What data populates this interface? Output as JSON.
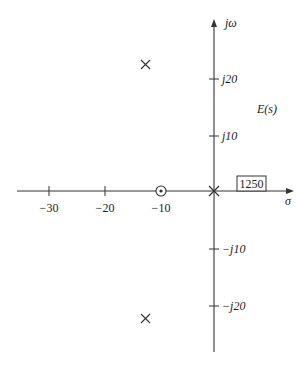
{
  "title": "E(s)",
  "axes": {
    "real_label": "σ",
    "imag_label": "jω",
    "real_ticks": [
      {
        "value": -30,
        "label": "−30"
      },
      {
        "value": -20,
        "label": "−20"
      },
      {
        "value": -10,
        "label": "−10"
      }
    ],
    "imag_ticks": [
      {
        "value": 20,
        "label": "j20"
      },
      {
        "value": 10,
        "label": "j10"
      },
      {
        "value": -10,
        "label": "−j10"
      },
      {
        "value": -20,
        "label": "−j20"
      }
    ]
  },
  "gain_box": "1250",
  "poles": [
    {
      "re": 0,
      "im": 0
    },
    {
      "re": -12.3,
      "im": 22.7
    },
    {
      "re": -12.3,
      "im": -22.7
    }
  ],
  "zeros": [
    {
      "re": -10,
      "im": 0
    }
  ],
  "colors": {
    "line": "#333333",
    "text": "#222222",
    "background": "#ffffff"
  }
}
